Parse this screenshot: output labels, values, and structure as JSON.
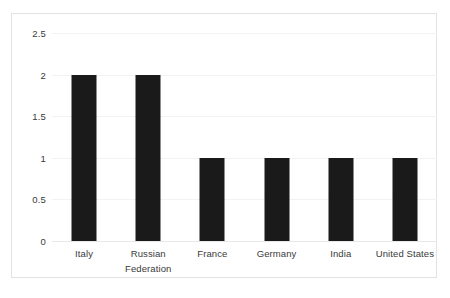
{
  "chart_data": {
    "type": "bar",
    "title": "",
    "subtitle": "",
    "xlabel": "",
    "ylabel": "",
    "categories": [
      "Italy",
      "Russian Federation",
      "France",
      "Germany",
      "India",
      "United States"
    ],
    "values": [
      2,
      2,
      1,
      1,
      1,
      1
    ],
    "series": [
      {
        "name": "",
        "values": [
          2,
          2,
          1,
          1,
          1,
          1
        ]
      }
    ],
    "ylim": [
      0,
      2.5
    ],
    "yticks": [
      0,
      0.5,
      1,
      1.5,
      2,
      2.5
    ],
    "ytick_labels": [
      "0",
      "0.5",
      "1",
      "1.5",
      "2",
      "2.5"
    ],
    "grid": true,
    "grid_axis": "y",
    "legend": false,
    "legend_position": "none",
    "bar_color": "#1a1a1a",
    "gridline_color": "#f2f2f3",
    "axis_label_color": "#3a3a3a",
    "plot_border_color": "#e3e3e5",
    "background_color": "#ffffff"
  }
}
